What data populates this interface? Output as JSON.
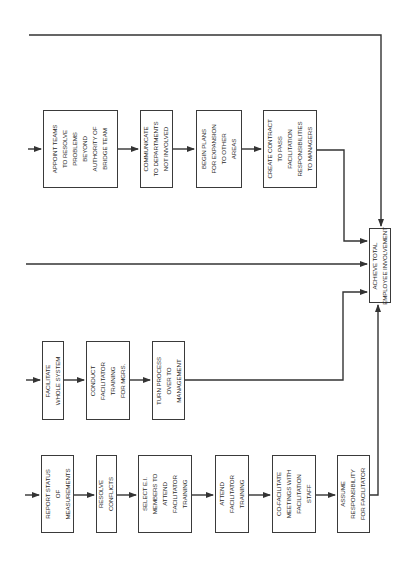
{
  "diagram": {
    "orientation": "rotated-90-counterclockwise",
    "rows": [
      {
        "id": "top",
        "steps": [
          {
            "label": "APPOINT TEAMS\nTO RESOLVE\nPROBLEMS\nBEYOND\nAUTHORITY OF\nBRIDGE TEAM"
          },
          {
            "label": "COMMUNICATE\nTO DEPARTMENTS\nNOT INVOLVED"
          },
          {
            "label": "BEGIN PLANS\nFOR EXPANSION\nTO OTHER\nAREAS"
          },
          {
            "label": "CREATE CONTRACT\nTO PASS\nFACILITATION\nRESPONSIBILITIES\nTO MANAGERS"
          }
        ]
      },
      {
        "id": "middle",
        "steps": [
          {
            "label": "FACILITATE\nWHOLE SYSTEM"
          },
          {
            "label": "CONDUCT\nFACILITATOR\nTRAINING\nFOR MGRS."
          },
          {
            "label": "TURN PROCESS\nOVER TO\nMANAGEMENT"
          }
        ]
      },
      {
        "id": "bottom",
        "steps": [
          {
            "label": "REPORT STATUS\nOF\nMEASUREMENTS"
          },
          {
            "label": "RESOLVE\nCONFLICTS"
          },
          {
            "label": "SELECT E.I.\nMEMBERS TO\nATTEND\nFACILITATOR\nTRAINING"
          },
          {
            "label": "ATTEND\nFACILITATOR\nTRAINING"
          },
          {
            "label": "CO-FACILITATE\nMEETINGS WITH\nFACILITATION\nSTAFF"
          },
          {
            "label": "ASSUME\nRESPONSIBILITY\nFOR FACILITATOR"
          }
        ]
      }
    ],
    "goal": {
      "label": "ACHIEVE TOTAL\nEMPLOYEE INVOLVEMENT"
    },
    "colors": {
      "line": "#333333",
      "box_border": "#3a3a3a",
      "text": "#2a2a2a",
      "background": "#ffffff"
    }
  }
}
